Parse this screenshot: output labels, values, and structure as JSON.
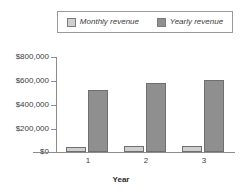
{
  "chart_data": {
    "type": "bar",
    "title": "",
    "subtitle": "",
    "xlabel": "Year",
    "ylabel": "",
    "categories": [
      "1",
      "2",
      "3"
    ],
    "series": [
      {
        "name": "Monthly revenue",
        "values": [
          45000,
          48000,
          50000
        ],
        "color": "#cfcfcf"
      },
      {
        "name": "Yearly revenue",
        "values": [
          520000,
          580000,
          610000
        ],
        "color": "#8f8f8f"
      }
    ],
    "ylim": [
      0,
      800000
    ],
    "ytick_labels": [
      "$800,000",
      "$600,000",
      "$400,000",
      "$200,000",
      "$0"
    ],
    "ytick_values": [
      800000,
      600000,
      400000,
      200000,
      0
    ],
    "xtick_labels": [
      "1",
      "2",
      "3"
    ],
    "grid": false,
    "legend_position": "top",
    "legend_entries": [
      "Monthly revenue",
      "Yearly revenue"
    ]
  },
  "legend": {
    "entries": [
      {
        "label": "Monthly revenue",
        "swatch": "legend-swatch-monthly"
      },
      {
        "label": "Yearly revenue",
        "swatch": "legend-swatch-yearly"
      }
    ]
  },
  "axes": {
    "y_labels": [
      "$800,000",
      "$600,000",
      "$400,000",
      "$200,000",
      "$0"
    ],
    "x_labels": [
      "1",
      "2",
      "3"
    ],
    "x_title": "Year"
  },
  "colors": {
    "monthly": "#cfcfcf",
    "yearly": "#8f8f8f",
    "axis": "#8c8c8c",
    "text": "#3b3b3b",
    "background": "#ffffff"
  }
}
